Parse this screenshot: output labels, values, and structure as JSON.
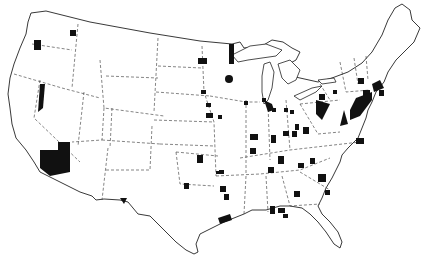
{
  "map": {
    "title": "",
    "region": "Contiguous United States",
    "style": "black-and-white outline map with state borders (dashed) and highlighted counties (solid black)",
    "colors": {
      "background": "#ffffff",
      "outline": "#222222",
      "highlight": "#111111"
    },
    "highlighted_regions_count": 60
  }
}
